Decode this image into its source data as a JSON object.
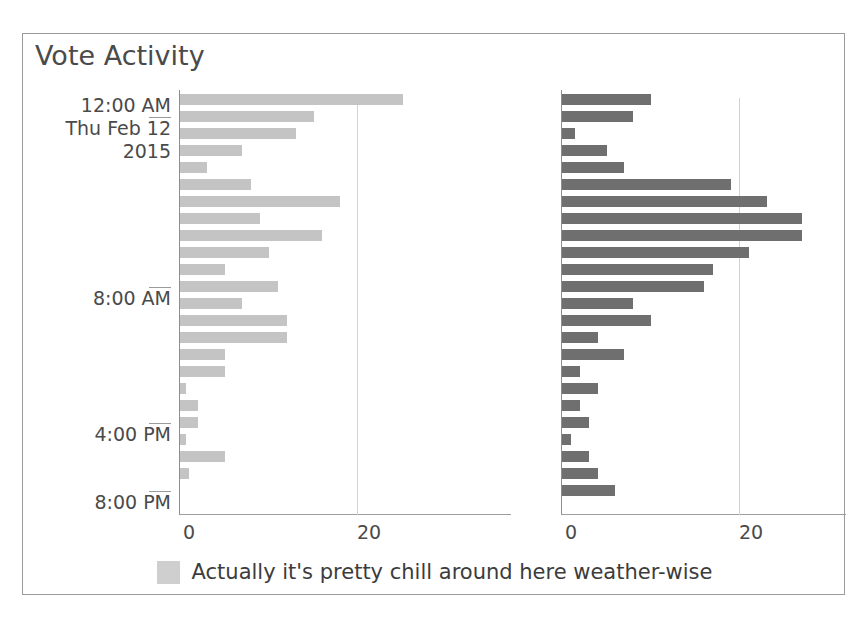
{
  "top_artifact": "",
  "chart": {
    "title": "Vote Activity",
    "legend": {
      "swatch_color": "#cfcfcf",
      "label": "Actually it's pretty chill around here weather-wise"
    },
    "colors": {
      "series_left": "#c4c4c4",
      "series_right": "#6f6f6f",
      "axis": "#8e8e8e",
      "grid": "#d2d2d2",
      "frame": "#9a9a9a",
      "text": "#4a4a4a"
    },
    "x_ticks": [
      "0",
      "20"
    ],
    "y_ticks": [
      {
        "label_lines": [
          "12:00 AM",
          "Thu Feb 12",
          "2015"
        ],
        "bar_index": 1
      },
      {
        "label_lines": [
          "8:00 AM"
        ],
        "bar_index": 11
      },
      {
        "label_lines": [
          "4:00 PM"
        ],
        "bar_index": 19
      },
      {
        "label_lines": [
          "8:00 PM"
        ],
        "bar_index": 23
      }
    ]
  },
  "chart_data": {
    "type": "bar",
    "orientation": "horizontal",
    "title": "Vote Activity",
    "xlabel": "",
    "ylabel": "",
    "xlim": [
      0,
      30
    ],
    "grid": true,
    "legend_position": "bottom",
    "panels": [
      {
        "name": "left",
        "color": "#c4c4c4",
        "x_tick_labels": [
          "0",
          "20"
        ],
        "x_tick_values": [
          0,
          20
        ],
        "values": [
          25,
          15,
          13,
          7,
          3,
          8,
          18,
          9,
          16,
          10,
          5,
          11,
          7,
          12,
          12,
          5,
          5,
          0.7,
          2,
          2,
          0.7,
          5,
          1,
          0
        ]
      },
      {
        "name": "right",
        "color": "#6f6f6f",
        "x_tick_labels": [
          "0",
          "20"
        ],
        "x_tick_values": [
          0,
          20
        ],
        "values": [
          10,
          8,
          1.5,
          5,
          7,
          19,
          23,
          27,
          27,
          21,
          17,
          16,
          8,
          10,
          4,
          7,
          2,
          4,
          2,
          3,
          1,
          3,
          4,
          6
        ]
      }
    ],
    "categories": [
      "bar-0",
      "bar-1",
      "bar-2",
      "bar-3",
      "bar-4",
      "bar-5",
      "bar-6",
      "bar-7",
      "bar-8",
      "bar-9",
      "bar-10",
      "bar-11",
      "bar-12",
      "bar-13",
      "bar-14",
      "bar-15",
      "bar-16",
      "bar-17",
      "bar-18",
      "bar-19",
      "bar-20",
      "bar-21",
      "bar-22",
      "bar-23"
    ],
    "y_axis_ticks": [
      {
        "label": "12:00 AM Thu Feb 12 2015",
        "bar_index": 1
      },
      {
        "label": "8:00 AM",
        "bar_index": 11
      },
      {
        "label": "4:00 PM",
        "bar_index": 19
      },
      {
        "label": "8:00 PM",
        "bar_index": 23
      }
    ],
    "legend": [
      {
        "label": "Actually it's pretty chill around here weather-wise",
        "color": "#cfcfcf"
      }
    ]
  }
}
